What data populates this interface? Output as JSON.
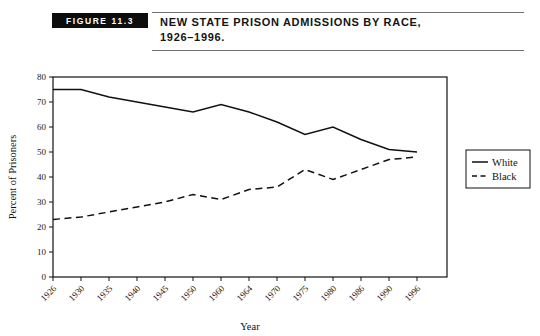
{
  "header": {
    "figure_tag": "FIGURE 11.3",
    "title_line1": "NEW STATE PRISON ADMISSIONS BY RACE,",
    "title_line2": "1926–1996."
  },
  "chart_data": {
    "type": "line",
    "xlabel": "Year",
    "ylabel": "Percent of Prisoners",
    "categories": [
      "1926",
      "1930",
      "1935",
      "1940",
      "1945",
      "1950",
      "1960",
      "1964",
      "1970",
      "1975",
      "1980",
      "1986",
      "1990",
      "1996"
    ],
    "ylim": [
      0,
      80
    ],
    "yticks": [
      0,
      10,
      20,
      30,
      40,
      50,
      60,
      70,
      80
    ],
    "grid": false,
    "legend_position": "right",
    "series": [
      {
        "name": "White",
        "style": "solid",
        "color": "#111111",
        "values": [
          75,
          75,
          72,
          70,
          68,
          66,
          69,
          66,
          62,
          57,
          60,
          55,
          51,
          50
        ]
      },
      {
        "name": "Black",
        "style": "dashed",
        "color": "#111111",
        "values": [
          23,
          24,
          26,
          28,
          30,
          33,
          31,
          35,
          36,
          43,
          39,
          43,
          47,
          48
        ]
      }
    ]
  }
}
